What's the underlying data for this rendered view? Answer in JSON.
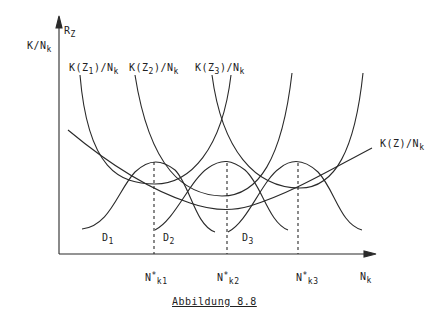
{
  "figure": {
    "caption": "Abbildung 8.8",
    "y_axis_label_top": "R",
    "y_axis_label_top_sub": "Z",
    "y_axis_label_main": "K/N",
    "y_axis_label_main_sub": "k",
    "x_axis_label": "N",
    "x_axis_label_sub": "k"
  },
  "curve_labels": {
    "u1": {
      "pre": "K(Z",
      "sub": "1",
      "post": ")/N",
      "post_sub": "k"
    },
    "u2": {
      "pre": "K(Z",
      "sub": "2",
      "post": ")/N",
      "post_sub": "k"
    },
    "u3": {
      "pre": "K(Z",
      "sub": "3",
      "post": ")/N",
      "post_sub": "k"
    },
    "envelope": {
      "pre": "K(Z)/N",
      "sub": "k"
    }
  },
  "demand_labels": [
    {
      "base": "D",
      "sub": "1"
    },
    {
      "base": "D",
      "sub": "2"
    },
    {
      "base": "D",
      "sub": "3"
    }
  ],
  "tick_labels": [
    {
      "base": "N",
      "sup": "*",
      "sub": "k1"
    },
    {
      "base": "N",
      "sup": "*",
      "sub": "k2"
    },
    {
      "base": "N",
      "sup": "*",
      "sub": "k3"
    }
  ],
  "colors": {
    "ink": "#2a2a2a",
    "background": "#ffffff"
  }
}
